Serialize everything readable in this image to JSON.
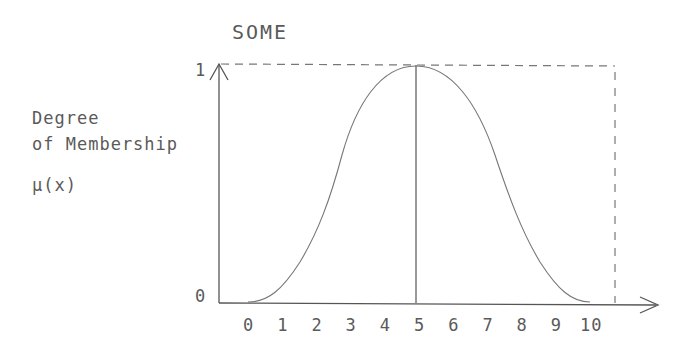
{
  "chart_data": {
    "type": "line",
    "title": "SOME",
    "ylabel": [
      "Degree",
      "of Membership",
      "μ(x)"
    ],
    "xlabel": "",
    "x_ticks": [
      "0",
      "1",
      "2",
      "3",
      "4",
      "5",
      "6",
      "7",
      "8",
      "9",
      "10"
    ],
    "y_ticks": [
      "0",
      "1"
    ],
    "ylim": [
      0,
      1
    ],
    "xlim": [
      0,
      10
    ],
    "grid": false,
    "series": [
      {
        "name": "SOME membership function",
        "x": [
          0,
          1,
          2,
          3,
          4,
          5,
          6,
          7,
          8,
          9,
          10
        ],
        "values": [
          0.0,
          0.1,
          0.28,
          0.62,
          0.9,
          1.0,
          0.9,
          0.62,
          0.28,
          0.08,
          0.0
        ]
      }
    ],
    "annotations": [
      {
        "type": "vertical-line",
        "x": 5,
        "label": "peak at x=5"
      },
      {
        "type": "dashed-bound",
        "desc": "dashed line at μ=1 from y-axis to right of x=10, dashed vertical down to baseline"
      }
    ]
  }
}
